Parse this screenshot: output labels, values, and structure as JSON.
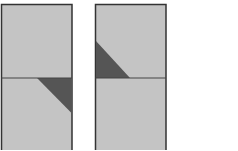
{
  "diagram": {
    "background": "#ffffff",
    "panel_fill": "#c4c4c4",
    "border_color": "#333333",
    "divider_color": "#444444",
    "triangle_fill": "#555555",
    "panels": [
      {
        "name": "left-panel",
        "x": 1.5,
        "y": 4.5,
        "width": 70.5,
        "height": 150,
        "divider_y": 78,
        "triangle_points": "37,78 71.5,78 71.5,113"
      },
      {
        "name": "right-panel",
        "x": 95.5,
        "y": 4.5,
        "width": 70.5,
        "height": 150,
        "divider_y": 78,
        "triangle_points": "96,41 96,78 130,78"
      }
    ]
  }
}
